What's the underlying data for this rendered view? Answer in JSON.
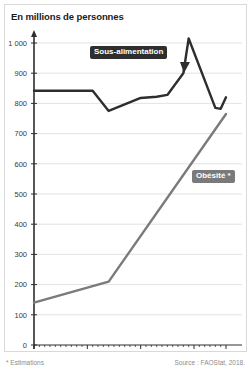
{
  "title": "En millions de personnes",
  "footnotes": {
    "left": "* Estimations",
    "right": "Source : FAOStat, 2018."
  },
  "labels": {
    "sous_alimentation": "Sous-alimentation",
    "obesite": "Obésité *"
  },
  "colors": {
    "sous_alimentation_line": "#2e2e2e",
    "obesite_line": "#7a7a7a",
    "gridline": "#e3e3e3",
    "axis": "#2e2e2e",
    "frame_border": "#d9d9d9",
    "background": "#ffffff",
    "tick_text": "#3a3a3a",
    "footnote_text": "#8c8c8c",
    "badge_dark": "#2e2e2e",
    "badge_gray": "#7a7a7a"
  },
  "y_ticks": [
    "0",
    "100",
    "200",
    "300",
    "400",
    "500",
    "600",
    "700",
    "800",
    "900",
    "1 000"
  ],
  "x_ticks": [
    "1980",
    "1990",
    "2000",
    "2010",
    "2016"
  ],
  "chart_data": {
    "type": "line",
    "title": "En millions de personnes",
    "xlabel": "",
    "ylabel": "En millions de personnes",
    "xlim": [
      1980,
      2016
    ],
    "ylim": [
      0,
      1000
    ],
    "y_tick_values": [
      0,
      100,
      200,
      300,
      400,
      500,
      600,
      700,
      800,
      900,
      1000
    ],
    "x_tick_values": [
      1980,
      1990,
      2000,
      2010,
      2016
    ],
    "grid": "horizontal",
    "legend": "inline-annotations",
    "annotations": [
      {
        "text": "Sous-alimentation",
        "series": "Sous-alimentation",
        "style": "dark-badge-with-pointer"
      },
      {
        "text": "Obésité *",
        "series": "Obésité *",
        "style": "gray-badge-with-pointer"
      }
    ],
    "series": [
      {
        "name": "Sous-alimentation",
        "color": "#2e2e2e",
        "points": [
          {
            "x": 1980,
            "y": 842
          },
          {
            "x": 1991,
            "y": 842
          },
          {
            "x": 1994,
            "y": 775
          },
          {
            "x": 2000,
            "y": 818
          },
          {
            "x": 2003,
            "y": 822
          },
          {
            "x": 2005,
            "y": 828
          },
          {
            "x": 2008,
            "y": 900
          },
          {
            "x": 2009,
            "y": 1015
          },
          {
            "x": 2014,
            "y": 785
          },
          {
            "x": 2015,
            "y": 782
          },
          {
            "x": 2016,
            "y": 820
          }
        ]
      },
      {
        "name": "Obésité *",
        "color": "#7a7a7a",
        "points": [
          {
            "x": 1980,
            "y": 140
          },
          {
            "x": 1994,
            "y": 210
          },
          {
            "x": 2016,
            "y": 765
          }
        ]
      }
    ]
  }
}
